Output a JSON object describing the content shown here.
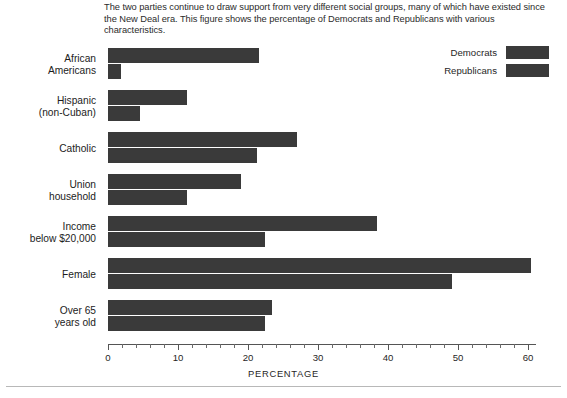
{
  "caption": "The two parties continue to draw support from very different social groups, many of which have existed since the New Deal era. This figure shows the percentage of Democrats and Republicans with various characteristics.",
  "legend": {
    "position": "top-right",
    "items": [
      {
        "label": "Democrats",
        "color": "#3a3a3a"
      },
      {
        "label": "Republicans",
        "color": "#3a3a3a"
      }
    ]
  },
  "axis": {
    "xlabel": "PERCENTAGE",
    "tick_labels": [
      "0",
      "10",
      "20",
      "30",
      "40",
      "50",
      "60"
    ],
    "tick_values": [
      0,
      10,
      20,
      30,
      40,
      50,
      60
    ],
    "minor_step": 2,
    "xlim": [
      0,
      60
    ]
  },
  "chart_data": {
    "type": "bar",
    "orientation": "horizontal",
    "title": "",
    "xlabel": "PERCENTAGE",
    "ylabel": "",
    "xlim": [
      0,
      60
    ],
    "grid": false,
    "legend_position": "top-right",
    "categories": [
      "African Americans",
      "Hispanic (non-Cuban)",
      "Catholic",
      "Union household",
      "Income below $20,000",
      "Female",
      "Over 65 years old"
    ],
    "category_lines": [
      [
        "African",
        "Americans"
      ],
      [
        "Hispanic",
        "(non-Cuban)"
      ],
      [
        "Catholic"
      ],
      [
        "Union",
        "household"
      ],
      [
        "Income",
        "below $20,000"
      ],
      [
        "Female"
      ],
      [
        "Over 65",
        "years old"
      ]
    ],
    "series": [
      {
        "name": "Democrats",
        "values": [
          21.5,
          11.3,
          27.0,
          19.0,
          38.4,
          60.4,
          23.4
        ]
      },
      {
        "name": "Republicans",
        "values": [
          1.8,
          4.6,
          21.3,
          11.3,
          22.4,
          49.1,
          22.4
        ]
      }
    ]
  }
}
